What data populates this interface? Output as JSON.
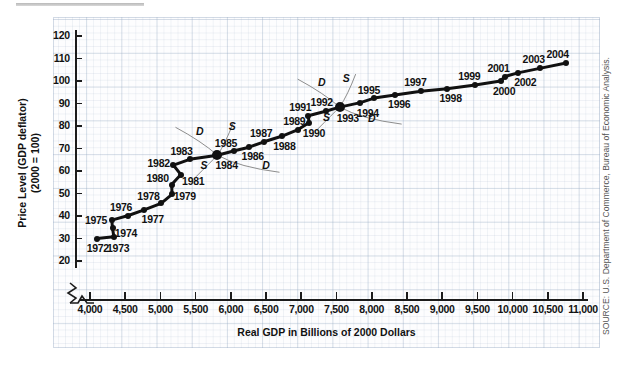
{
  "figure": {
    "source_note": "SOURCE: U.S. Department of Commerce, Bureau of Economic Analysis.",
    "ytitle_line1": "Price Level (GDP deflator)",
    "ytitle_line2": "(2000 = 100)",
    "xtitle": "Real GDP in Billions of 2000 Dollars"
  },
  "chart_data": {
    "type": "scatter",
    "title": "",
    "xlabel": "Real GDP in Billions of 2000 Dollars",
    "ylabel": "Price Level (GDP deflator) (2000 = 100)",
    "xlim": [
      3800,
      11000
    ],
    "ylim": [
      20,
      120
    ],
    "xticks": [
      "4,000",
      "4,500",
      "5,000",
      "5,500",
      "6,000",
      "6,500",
      "7,000",
      "7,500",
      "8,000",
      "8,500",
      "9,000",
      "9,500",
      "10,000",
      "10,500",
      "11,000"
    ],
    "xtick_values": [
      4000,
      4500,
      5000,
      5500,
      6000,
      6500,
      7000,
      7500,
      8000,
      8500,
      9000,
      9500,
      10000,
      10500,
      11000
    ],
    "yticks": [
      "20",
      "30",
      "40",
      "50",
      "60",
      "70",
      "80",
      "90",
      "100",
      "110",
      "120"
    ],
    "ytick_values": [
      20,
      30,
      40,
      50,
      60,
      70,
      80,
      90,
      100,
      110,
      120
    ],
    "grid": true,
    "legend_position": "none",
    "axis_break_x": true,
    "series_name": "U.S. real GDP and price level, 1972-2004",
    "points": [
      {
        "label": "1972",
        "x": 4100,
        "y": 30.0,
        "lx": 4110,
        "ly": 25.6
      },
      {
        "label": "1973",
        "x": 4340,
        "y": 30.8,
        "lx": 4400,
        "ly": 25.6
      },
      {
        "label": "1974",
        "x": 4320,
        "y": 34.6,
        "lx": 4510,
        "ly": 32.6
      },
      {
        "label": "1975",
        "x": 4310,
        "y": 38.2,
        "lx": 4085,
        "ly": 38.4
      },
      {
        "label": "1976",
        "x": 4545,
        "y": 40.2,
        "lx": 4440,
        "ly": 44.0
      },
      {
        "label": "1977",
        "x": 4760,
        "y": 42.6,
        "lx": 4890,
        "ly": 38.6
      },
      {
        "label": "1978",
        "x": 5010,
        "y": 45.6,
        "lx": 4830,
        "ly": 49.0
      },
      {
        "label": "1979",
        "x": 5165,
        "y": 49.6,
        "lx": 5345,
        "ly": 48.8
      },
      {
        "label": "1980",
        "x": 5160,
        "y": 54.0,
        "lx": 4960,
        "ly": 57.0
      },
      {
        "label": "1981",
        "x": 5290,
        "y": 58.4,
        "lx": 5465,
        "ly": 55.6
      },
      {
        "label": "1982",
        "x": 5185,
        "y": 62.6,
        "lx": 4975,
        "ly": 63.6
      },
      {
        "label": "1983",
        "x": 5415,
        "y": 65.2,
        "lx": 5300,
        "ly": 69.0
      },
      {
        "label": "1984",
        "x": 5810,
        "y": 67.0,
        "lx": 5940,
        "ly": 62.8
      },
      {
        "label": "1985",
        "x": 6050,
        "y": 69.0,
        "lx": 5930,
        "ly": 72.6
      },
      {
        "label": "1986",
        "x": 6260,
        "y": 70.6,
        "lx": 6310,
        "ly": 66.6
      },
      {
        "label": "1987",
        "x": 6470,
        "y": 73.0,
        "lx": 6430,
        "ly": 77.0
      },
      {
        "label": "1988",
        "x": 6720,
        "y": 75.4,
        "lx": 6760,
        "ly": 71.2
      },
      {
        "label": "1989",
        "x": 6955,
        "y": 78.4,
        "lx": 6900,
        "ly": 82.4
      },
      {
        "label": "1990",
        "x": 7110,
        "y": 81.4,
        "lx": 7180,
        "ly": 77.0
      },
      {
        "label": "1991",
        "x": 7100,
        "y": 84.6,
        "lx": 6985,
        "ly": 88.4
      },
      {
        "label": "1992",
        "x": 7345,
        "y": 86.6,
        "lx": 7290,
        "ly": 90.6
      },
      {
        "label": "1993",
        "x": 7545,
        "y": 88.4,
        "lx": 7660,
        "ly": 83.4
      },
      {
        "label": "1994",
        "x": 7840,
        "y": 90.4,
        "lx": 7945,
        "ly": 85.8
      },
      {
        "label": "1995",
        "x": 8035,
        "y": 92.4,
        "lx": 7960,
        "ly": 96.2
      },
      {
        "label": "1996",
        "x": 8330,
        "y": 93.8,
        "lx": 8390,
        "ly": 89.6
      },
      {
        "label": "1997",
        "x": 8700,
        "y": 95.4,
        "lx": 8620,
        "ly": 99.4
      },
      {
        "label": "1998",
        "x": 9070,
        "y": 96.6,
        "lx": 9120,
        "ly": 92.4
      },
      {
        "label": "1999",
        "x": 9470,
        "y": 98.2,
        "lx": 9385,
        "ly": 102.2
      },
      {
        "label": "2000",
        "x": 9830,
        "y": 100.0,
        "lx": 9880,
        "ly": 95.6
      },
      {
        "label": "2001",
        "x": 9890,
        "y": 102.0,
        "lx": 9800,
        "ly": 106.0
      },
      {
        "label": "2002",
        "x": 10075,
        "y": 103.6,
        "lx": 10180,
        "ly": 99.4
      },
      {
        "label": "2003",
        "x": 10385,
        "y": 105.6,
        "lx": 10300,
        "ly": 109.6
      },
      {
        "label": "2004",
        "x": 10760,
        "y": 108.0,
        "lx": 10640,
        "ly": 112.2
      }
    ],
    "annotations": [
      {
        "text": "D",
        "x": 5560,
        "y": 78.0,
        "note": "demand curve label, 1984 intersection, upper-left"
      },
      {
        "text": "S",
        "x": 6020,
        "y": 79.8,
        "note": "supply curve label, 1984 intersection, upper-right"
      },
      {
        "text": "S",
        "x": 5620,
        "y": 62.8,
        "note": "supply curve label, 1984 intersection, lower-left"
      },
      {
        "text": "D",
        "x": 6500,
        "y": 62.8,
        "note": "demand curve label, 1984 intersection, lower-right"
      },
      {
        "text": "D",
        "x": 7290,
        "y": 99.6,
        "note": "demand curve label, 1993 intersection, upper-left"
      },
      {
        "text": "S",
        "x": 7640,
        "y": 101.2,
        "note": "supply curve label, 1993 intersection, upper-right"
      },
      {
        "text": "S",
        "x": 7360,
        "y": 84.0,
        "note": "supply curve label, 1993 intersection, lower-left"
      },
      {
        "text": "D",
        "x": 8000,
        "y": 83.4,
        "note": "demand curve label, 1993 intersection, lower-right"
      }
    ],
    "intersections": [
      {
        "year": "1984",
        "x": 5810,
        "y": 67.0
      },
      {
        "year": "1993",
        "x": 7545,
        "y": 88.4
      }
    ]
  }
}
